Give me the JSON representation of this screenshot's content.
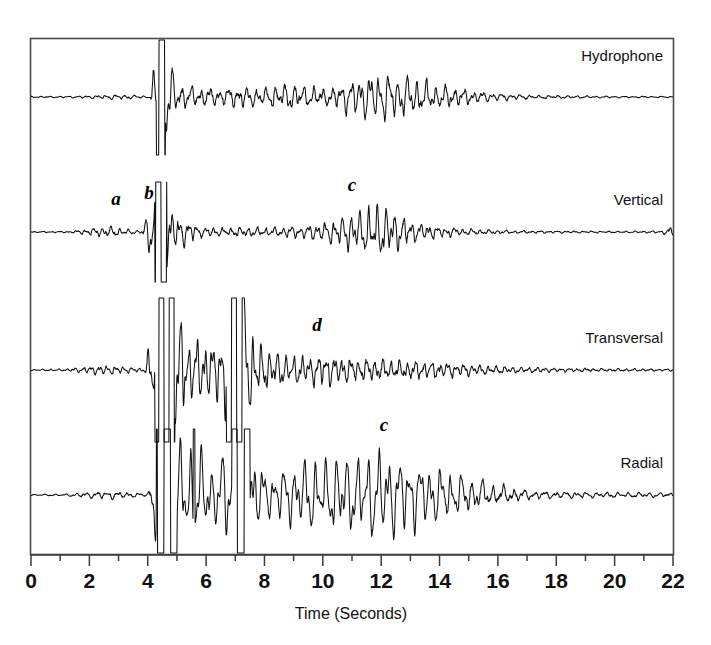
{
  "figure": {
    "name": "multi-channel-seismogram",
    "background": "#ffffff",
    "ink": "#111111"
  },
  "axis": {
    "title": "Time (Seconds)",
    "tick_labels": [
      "0",
      "2",
      "4",
      "6",
      "8",
      "10",
      "12",
      "14",
      "16",
      "18",
      "20",
      "22"
    ],
    "tick_values": [
      0,
      2,
      4,
      6,
      8,
      10,
      12,
      14,
      16,
      18,
      20,
      22
    ],
    "minor_tick_values": [
      1,
      3,
      5,
      7,
      9,
      11,
      13,
      15,
      17,
      19,
      21
    ],
    "range": [
      0,
      22
    ],
    "units": "Seconds"
  },
  "traces": [
    {
      "label": "Hydrophone",
      "baseline_px": 97,
      "clipped": true
    },
    {
      "label": "Vertical",
      "baseline_px": 232,
      "clipped": true
    },
    {
      "label": "Transversal",
      "baseline_px": 370,
      "clipped": true
    },
    {
      "label": "Radial",
      "baseline_px": 495,
      "clipped": true
    }
  ],
  "annotations": [
    {
      "text": "a",
      "trace": "Vertical",
      "time": 2.7,
      "x_px": 116,
      "y_px": 205
    },
    {
      "text": "b",
      "trace": "Vertical",
      "time": 4.0,
      "x_px": 149,
      "y_px": 199
    },
    {
      "text": "c",
      "trace": "Vertical",
      "time": 11.0,
      "x_px": 352,
      "y_px": 191
    },
    {
      "text": "d",
      "trace": "Transversal",
      "time": 9.7,
      "x_px": 317,
      "y_px": 331
    },
    {
      "text": "c",
      "trace": "Radial",
      "time": 12.0,
      "x_px": 384,
      "y_px": 431
    }
  ],
  "chart_data": {
    "type": "line",
    "title": "",
    "subtitle": "",
    "xlabel": "Time (Seconds)",
    "ylabel": "",
    "xlim": [
      0,
      22
    ],
    "grid": false,
    "legend": "none",
    "channel_labels_position": "right-inside",
    "xticks": [
      0,
      2,
      4,
      6,
      8,
      10,
      12,
      14,
      16,
      18,
      20,
      22
    ],
    "xtick_labels": [
      "0",
      "2",
      "4",
      "6",
      "8",
      "10",
      "12",
      "14",
      "16",
      "18",
      "20",
      "22"
    ],
    "minor_xticks": [
      1,
      3,
      5,
      7,
      9,
      11,
      13,
      15,
      17,
      19,
      21
    ],
    "annotations": [
      {
        "label": "a",
        "x": 2.7,
        "series": "Vertical"
      },
      {
        "label": "b",
        "x": 4.0,
        "series": "Vertical"
      },
      {
        "label": "c",
        "x": 11.0,
        "series": "Vertical"
      },
      {
        "label": "d",
        "x": 9.7,
        "series": "Transversal"
      },
      {
        "label": "c",
        "x": 12.0,
        "series": "Radial"
      }
    ],
    "series": [
      {
        "name": "Hydrophone",
        "baseline_px": 97,
        "clip_amplitude_px": 58,
        "envelope": [
          {
            "t": 0.0,
            "amp": 0.8
          },
          {
            "t": 1.5,
            "amp": 1.2
          },
          {
            "t": 2.4,
            "amp": 2.2
          },
          {
            "t": 3.0,
            "amp": 3.2
          },
          {
            "t": 3.6,
            "amp": 2.0
          },
          {
            "t": 4.1,
            "amp": 1.2
          },
          {
            "t": 4.3,
            "amp": 58.0
          },
          {
            "t": 4.45,
            "amp": 58.0
          },
          {
            "t": 4.6,
            "amp": 58.0
          },
          {
            "t": 4.8,
            "amp": 40.0
          },
          {
            "t": 5.0,
            "amp": 16.0
          },
          {
            "t": 5.6,
            "amp": 12.0
          },
          {
            "t": 6.4,
            "amp": 10.0
          },
          {
            "t": 7.2,
            "amp": 13.0
          },
          {
            "t": 8.0,
            "amp": 11.0
          },
          {
            "t": 8.8,
            "amp": 16.0
          },
          {
            "t": 9.4,
            "amp": 13.0
          },
          {
            "t": 10.2,
            "amp": 10.0
          },
          {
            "t": 10.8,
            "amp": 19.0
          },
          {
            "t": 11.4,
            "amp": 26.0
          },
          {
            "t": 12.0,
            "amp": 30.0
          },
          {
            "t": 12.6,
            "amp": 27.0
          },
          {
            "t": 13.2,
            "amp": 22.0
          },
          {
            "t": 14.0,
            "amp": 15.0
          },
          {
            "t": 14.8,
            "amp": 10.0
          },
          {
            "t": 15.6,
            "amp": 6.0
          },
          {
            "t": 16.4,
            "amp": 3.5
          },
          {
            "t": 17.4,
            "amp": 2.2
          },
          {
            "t": 18.5,
            "amp": 1.6
          },
          {
            "t": 20.0,
            "amp": 1.1
          },
          {
            "t": 22.0,
            "amp": 0.8
          }
        ],
        "dominant_frequency_hz": 3.1
      },
      {
        "name": "Vertical",
        "baseline_px": 232,
        "clip_amplitude_px": 50,
        "envelope": [
          {
            "t": 0.0,
            "amp": 0.7
          },
          {
            "t": 1.4,
            "amp": 1.0
          },
          {
            "t": 2.2,
            "amp": 5.0
          },
          {
            "t": 2.7,
            "amp": 7.0
          },
          {
            "t": 3.2,
            "amp": 4.0
          },
          {
            "t": 3.8,
            "amp": 1.6
          },
          {
            "t": 4.25,
            "amp": 50.0
          },
          {
            "t": 4.45,
            "amp": 50.0
          },
          {
            "t": 4.65,
            "amp": 50.0
          },
          {
            "t": 4.85,
            "amp": 24.0
          },
          {
            "t": 5.0,
            "amp": 22.0
          },
          {
            "t": 5.3,
            "amp": 16.0
          },
          {
            "t": 5.8,
            "amp": 6.0
          },
          {
            "t": 6.6,
            "amp": 5.0
          },
          {
            "t": 7.4,
            "amp": 6.0
          },
          {
            "t": 8.2,
            "amp": 5.0
          },
          {
            "t": 9.0,
            "amp": 7.0
          },
          {
            "t": 9.6,
            "amp": 9.0
          },
          {
            "t": 10.2,
            "amp": 13.0
          },
          {
            "t": 10.8,
            "amp": 21.0
          },
          {
            "t": 11.3,
            "amp": 27.0
          },
          {
            "t": 11.8,
            "amp": 34.0
          },
          {
            "t": 12.2,
            "amp": 30.0
          },
          {
            "t": 12.7,
            "amp": 20.0
          },
          {
            "t": 13.2,
            "amp": 12.0
          },
          {
            "t": 13.9,
            "amp": 7.0
          },
          {
            "t": 14.7,
            "amp": 4.5
          },
          {
            "t": 15.6,
            "amp": 2.8
          },
          {
            "t": 16.6,
            "amp": 1.8
          },
          {
            "t": 18.0,
            "amp": 1.3
          },
          {
            "t": 20.0,
            "amp": 1.0
          },
          {
            "t": 21.6,
            "amp": 1.4
          },
          {
            "t": 22.0,
            "amp": 7.0
          }
        ],
        "dominant_frequency_hz": 3.4
      },
      {
        "name": "Transversal",
        "baseline_px": 370,
        "clip_amplitude_px": 72,
        "envelope": [
          {
            "t": 0.0,
            "amp": 0.8
          },
          {
            "t": 1.2,
            "amp": 1.4
          },
          {
            "t": 2.0,
            "amp": 4.5
          },
          {
            "t": 2.6,
            "amp": 6.0
          },
          {
            "t": 3.2,
            "amp": 4.0
          },
          {
            "t": 3.9,
            "amp": 2.0
          },
          {
            "t": 4.25,
            "amp": 72.0
          },
          {
            "t": 4.6,
            "amp": 72.0
          },
          {
            "t": 4.9,
            "amp": 72.0
          },
          {
            "t": 5.2,
            "amp": 60.0
          },
          {
            "t": 5.5,
            "amp": 35.0
          },
          {
            "t": 5.9,
            "amp": 42.0
          },
          {
            "t": 6.3,
            "amp": 30.0
          },
          {
            "t": 6.7,
            "amp": 72.0
          },
          {
            "t": 7.0,
            "amp": 72.0
          },
          {
            "t": 7.3,
            "amp": 72.0
          },
          {
            "t": 7.6,
            "amp": 48.0
          },
          {
            "t": 7.9,
            "amp": 30.0
          },
          {
            "t": 8.3,
            "amp": 22.0
          },
          {
            "t": 8.9,
            "amp": 19.0
          },
          {
            "t": 9.5,
            "amp": 17.0
          },
          {
            "t": 10.1,
            "amp": 20.0
          },
          {
            "t": 10.7,
            "amp": 16.0
          },
          {
            "t": 11.3,
            "amp": 14.0
          },
          {
            "t": 11.9,
            "amp": 13.0
          },
          {
            "t": 12.6,
            "amp": 12.0
          },
          {
            "t": 13.4,
            "amp": 11.0
          },
          {
            "t": 14.2,
            "amp": 9.0
          },
          {
            "t": 15.0,
            "amp": 7.0
          },
          {
            "t": 15.8,
            "amp": 5.0
          },
          {
            "t": 16.8,
            "amp": 3.5
          },
          {
            "t": 18.0,
            "amp": 2.5
          },
          {
            "t": 19.5,
            "amp": 1.8
          },
          {
            "t": 22.0,
            "amp": 1.4
          }
        ],
        "dominant_frequency_hz": 3.6
      },
      {
        "name": "Radial",
        "baseline_px": 495,
        "clip_amplitude_px": 66,
        "envelope": [
          {
            "t": 0.0,
            "amp": 0.8
          },
          {
            "t": 1.2,
            "amp": 1.3
          },
          {
            "t": 2.1,
            "amp": 4.0
          },
          {
            "t": 2.7,
            "amp": 5.0
          },
          {
            "t": 3.3,
            "amp": 3.2
          },
          {
            "t": 4.0,
            "amp": 1.8
          },
          {
            "t": 4.3,
            "amp": 66.0
          },
          {
            "t": 4.6,
            "amp": 66.0
          },
          {
            "t": 4.95,
            "amp": 66.0
          },
          {
            "t": 5.3,
            "amp": 60.0
          },
          {
            "t": 5.6,
            "amp": 66.0
          },
          {
            "t": 5.9,
            "amp": 50.0
          },
          {
            "t": 6.2,
            "amp": 36.0
          },
          {
            "t": 6.6,
            "amp": 52.0
          },
          {
            "t": 6.9,
            "amp": 66.0
          },
          {
            "t": 7.2,
            "amp": 66.0
          },
          {
            "t": 7.5,
            "amp": 66.0
          },
          {
            "t": 7.8,
            "amp": 40.0
          },
          {
            "t": 8.1,
            "amp": 26.0
          },
          {
            "t": 8.6,
            "amp": 34.0
          },
          {
            "t": 9.1,
            "amp": 40.0
          },
          {
            "t": 9.6,
            "amp": 46.0
          },
          {
            "t": 10.1,
            "amp": 42.0
          },
          {
            "t": 10.6,
            "amp": 50.0
          },
          {
            "t": 11.1,
            "amp": 47.0
          },
          {
            "t": 11.6,
            "amp": 54.0
          },
          {
            "t": 12.0,
            "amp": 57.0
          },
          {
            "t": 12.5,
            "amp": 50.0
          },
          {
            "t": 13.0,
            "amp": 44.0
          },
          {
            "t": 13.6,
            "amp": 38.0
          },
          {
            "t": 14.2,
            "amp": 31.0
          },
          {
            "t": 14.8,
            "amp": 24.0
          },
          {
            "t": 15.4,
            "amp": 18.0
          },
          {
            "t": 16.0,
            "amp": 12.0
          },
          {
            "t": 16.6,
            "amp": 8.0
          },
          {
            "t": 17.2,
            "amp": 5.5
          },
          {
            "t": 18.0,
            "amp": 4.2
          },
          {
            "t": 19.0,
            "amp": 3.6
          },
          {
            "t": 20.2,
            "amp": 3.2
          },
          {
            "t": 21.4,
            "amp": 3.0
          },
          {
            "t": 22.0,
            "amp": 3.0
          }
        ],
        "dominant_frequency_hz": 2.8
      }
    ]
  }
}
